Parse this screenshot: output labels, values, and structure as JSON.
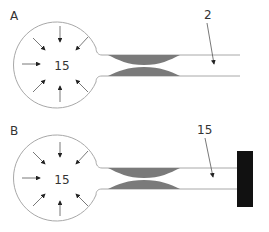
{
  "panels": [
    {
      "label": "A",
      "pressure": "15",
      "tube_pressure": "2",
      "tube_end": "open"
    },
    {
      "label": "B",
      "pressure": "15",
      "tube_pressure": "15",
      "tube_end": "closed"
    }
  ],
  "colors": {
    "outline": "#a8a8a8",
    "constriction": "#7a7a7a",
    "arrow": "#333333",
    "cap": "#111111"
  }
}
